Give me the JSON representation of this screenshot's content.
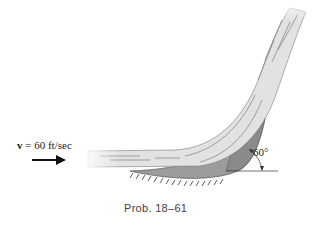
{
  "figure": {
    "velocity_symbol": "v",
    "velocity_text": " = 60 ft/sec",
    "angle_label": "60°",
    "caption": "Prob. 18–61"
  },
  "colors": {
    "jet_fill": "#e4e4e4",
    "jet_stroke": "#777777",
    "vane_fill": "#9a9a9a",
    "vane_dark": "#888888",
    "arrow": "#111111"
  }
}
